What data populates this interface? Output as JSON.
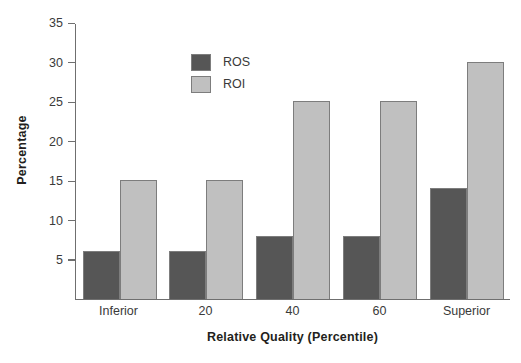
{
  "chart_data": {
    "type": "bar",
    "title": "",
    "subtitle": "",
    "xlabel": "Relative Quality (Percentile)",
    "ylabel": "Percentage",
    "categories": [
      "Inferior",
      "20",
      "40",
      "60",
      "Superior"
    ],
    "series": [
      {
        "name": "ROS",
        "values": [
          6,
          6,
          8,
          8,
          14
        ],
        "color": "#565656"
      },
      {
        "name": "ROI",
        "values": [
          15,
          15,
          25,
          25,
          30
        ],
        "color": "#c0c0c0"
      }
    ],
    "ylim": [
      0,
      35
    ],
    "yticks": [
      5,
      10,
      15,
      20,
      25,
      30,
      35
    ],
    "ytick_labels": [
      "5",
      "10",
      "15",
      "20",
      "25",
      "30",
      "35"
    ],
    "grid": false,
    "legend_position": "top-left-inside",
    "orientation": "vertical",
    "grouping": "grouped"
  },
  "legend": {
    "entries": [
      {
        "label": "ROS",
        "color": "#565656"
      },
      {
        "label": "ROI",
        "color": "#c0c0c0"
      }
    ]
  },
  "axes": {
    "y_title": "Percentage",
    "x_title": "Relative Quality (Percentile)",
    "y_tick_labels": [
      "35",
      "30",
      "25",
      "20",
      "15",
      "10",
      "5"
    ],
    "x_tick_labels": [
      "Inferior",
      "20",
      "40",
      "60",
      "Superior"
    ]
  }
}
